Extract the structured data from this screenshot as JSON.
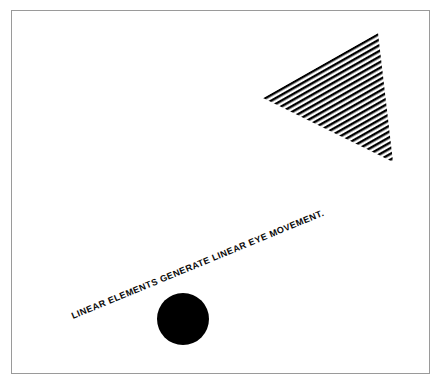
{
  "figure": {
    "background_color": "#ffffff",
    "ink_color": "#000000",
    "border": {
      "name": "figure-border-frame",
      "color": "#9a9a9a",
      "width_px": 1,
      "x": 11,
      "y": 10,
      "width": 419,
      "height": 364
    },
    "caption": {
      "text": "LINEAR ELEMENTS GENERATE LINEAR EYE MOVEMENT.",
      "color": "#0a0a0a",
      "rotation_deg": -22.4,
      "start_x": 73,
      "start_y": 319,
      "end_x": 287,
      "end_y": 230,
      "font_size_px": 9.1,
      "uppercase": true
    },
    "shapes": [
      {
        "name": "striped-triangle",
        "type": "triangle",
        "fill_style": "diagonal-stripes",
        "stripe_color": "#000000",
        "stripe_gap_color": "#ffffff",
        "stripe_period_px": 5.0,
        "stripe_width_px": 2.4,
        "stripe_angle_deg": -29.5,
        "vertices": [
          {
            "x": 263,
            "y": 98
          },
          {
            "x": 378,
            "y": 33
          },
          {
            "x": 393,
            "y": 162
          }
        ]
      },
      {
        "name": "solid-circle",
        "type": "circle",
        "fill_style": "solid",
        "fill_color": "#000000",
        "center_x": 183,
        "center_y": 319,
        "radius_px": 26
      }
    ]
  }
}
